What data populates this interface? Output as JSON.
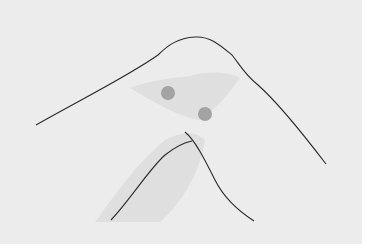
{
  "figure": {
    "background": "#ececec",
    "border": "#ffffff",
    "stroke_color": "#2a2a2a",
    "dot_color": "#a3a3a3",
    "shadow_color": "#dadada",
    "dots": [
      {
        "cx": 168,
        "cy": 93,
        "r": 7
      },
      {
        "cx": 205,
        "cy": 114,
        "r": 7
      }
    ]
  }
}
